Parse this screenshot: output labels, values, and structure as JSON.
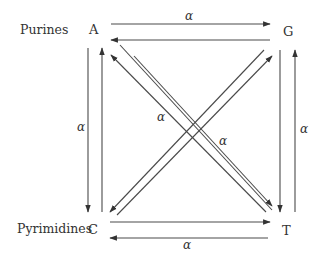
{
  "diagram": {
    "type": "nucleotide-substitution-model",
    "categories": {
      "top": "Purines",
      "bottom": "Pyrimidines"
    },
    "nodes": [
      {
        "id": "A",
        "label": "A",
        "row": "Purines"
      },
      {
        "id": "G",
        "label": "G",
        "row": "Purines"
      },
      {
        "id": "C",
        "label": "C",
        "row": "Pyrimidines"
      },
      {
        "id": "T",
        "label": "T",
        "row": "Pyrimidines"
      }
    ],
    "edges": [
      {
        "from": "A",
        "to": "G",
        "label": "α"
      },
      {
        "from": "G",
        "to": "A",
        "label": ""
      },
      {
        "from": "A",
        "to": "C",
        "label": "α"
      },
      {
        "from": "C",
        "to": "A",
        "label": ""
      },
      {
        "from": "G",
        "to": "T",
        "label": ""
      },
      {
        "from": "T",
        "to": "G",
        "label": "α"
      },
      {
        "from": "C",
        "to": "T",
        "label": ""
      },
      {
        "from": "T",
        "to": "C",
        "label": "α"
      },
      {
        "from": "A",
        "to": "T",
        "label": "α"
      },
      {
        "from": "T",
        "to": "A",
        "label": ""
      },
      {
        "from": "G",
        "to": "C",
        "label": "α"
      },
      {
        "from": "C",
        "to": "G",
        "label": ""
      }
    ],
    "rate_symbol": "α",
    "colors": {
      "line": "#4a4a4a",
      "text": "#333333",
      "background": "#ffffff"
    }
  }
}
